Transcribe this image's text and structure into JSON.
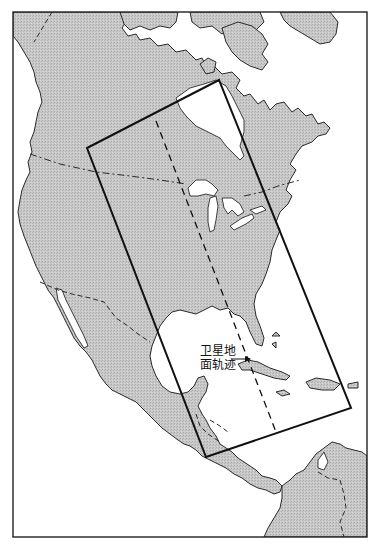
{
  "map": {
    "title": "",
    "region": "North America",
    "colors": {
      "land": "#c6c6c6",
      "water": "#ffffff",
      "outline": "#2a2a2a",
      "swath": "#111111"
    },
    "frame": {
      "x": 13,
      "y": 12,
      "width": 354,
      "height": 525
    },
    "swath_corners": [
      [
        87,
        148
      ],
      [
        219,
        80
      ],
      [
        351,
        408
      ],
      [
        206,
        457
      ]
    ],
    "ground_track": {
      "start": [
        156,
        121
      ],
      "end": [
        276,
        432
      ]
    },
    "annotations": [
      {
        "id": "ground-track-label",
        "lines": [
          "卫星地",
          "面轨迹"
        ],
        "text": "卫星地面轨迹",
        "position": [
          200,
          346
        ],
        "arrow_to": [
          250,
          360
        ]
      }
    ]
  }
}
